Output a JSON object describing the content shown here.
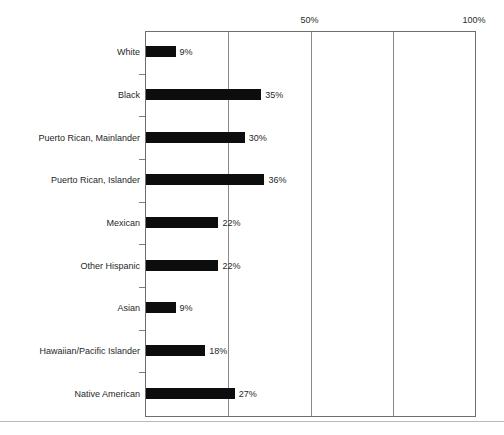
{
  "chart_data": {
    "type": "bar",
    "orientation": "horizontal",
    "title": "",
    "subtitle": "",
    "xlabel": "",
    "ylabel": "",
    "xlim": [
      0,
      100
    ],
    "grid": true,
    "gridlines": [
      0,
      25,
      50,
      75,
      100
    ],
    "legend": null,
    "legend_position": "none",
    "value_suffix": "%",
    "axis_position": "top",
    "xtick_labels": [
      "50%",
      "100%"
    ],
    "xtick_values": [
      50,
      100
    ],
    "categories": [
      "White",
      "Black",
      "Puerto Rican, Mainlander",
      "Puerto Rican, Islander",
      "Mexican",
      "Other Hispanic",
      "Asian",
      "Hawaiian/Pacific Islander",
      "Native American"
    ],
    "values": [
      9,
      35,
      30,
      36,
      22,
      22,
      9,
      18,
      27
    ],
    "value_labels": [
      "9%",
      "35%",
      "30%",
      "36%",
      "22%",
      "22%",
      "9%",
      "18%",
      "27%"
    ],
    "bar_color": "#0d0d0d",
    "axis_color": "#6e6e6e",
    "gridline_color": "#8a8a8a"
  }
}
